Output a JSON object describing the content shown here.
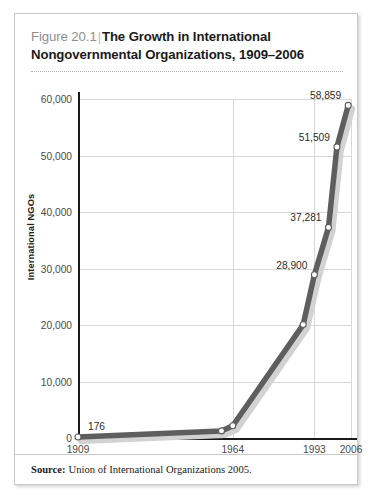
{
  "figure": {
    "number": "Figure 20.1",
    "separator": "|",
    "name": "The Growth in International Nongovernmental Organizations, 1909–2006"
  },
  "source": {
    "label": "Source:",
    "text": "Union of International Organizations 2005."
  },
  "chart_data": {
    "type": "line",
    "title": "The Growth in International Nongovernmental Organizations, 1909–2006",
    "xlabel": "",
    "ylabel": "International NGOs",
    "ylim": [
      0,
      60000
    ],
    "xlim": [
      1909,
      2006
    ],
    "grid": true,
    "legend": false,
    "y_ticks": [
      0,
      10000,
      20000,
      30000,
      40000,
      50000,
      60000
    ],
    "y_tick_labels": [
      "0",
      "10,000",
      "20,000",
      "30,000",
      "40,000",
      "50,000",
      "60,000"
    ],
    "x_ticks": [
      1909,
      1964,
      1993,
      2006
    ],
    "x_tick_labels": [
      "1909",
      "1964",
      "1993",
      "2006"
    ],
    "x": [
      1909,
      1960,
      1964,
      1989,
      1993,
      1998,
      2001,
      2005
    ],
    "values": [
      176,
      1255,
      2173,
      20063,
      28900,
      37281,
      51509,
      58859
    ],
    "point_labels": [
      {
        "x": 1909,
        "value": 176,
        "text": "176"
      },
      {
        "x": 1993,
        "value": 28900,
        "text": "28,900"
      },
      {
        "x": 1998,
        "value": 37281,
        "text": "37,281"
      },
      {
        "x": 2001,
        "value": 51509,
        "text": "51,509"
      },
      {
        "x": 2005,
        "value": 58859,
        "text": "58,859"
      }
    ],
    "line_color": "#5e5e5e",
    "shadow_color": "#d2d2d2",
    "marker_fill": "#ffffff",
    "marker_edge": "#5e5e5e"
  }
}
